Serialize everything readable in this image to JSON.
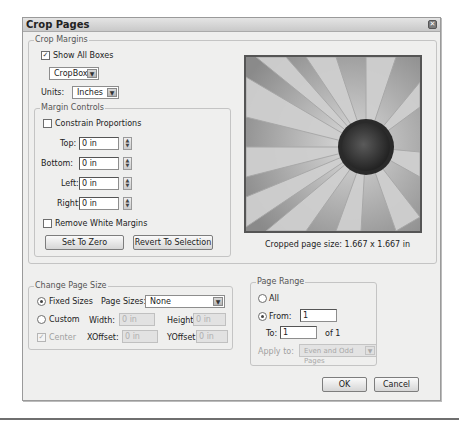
{
  "window": {
    "title": "Crop Pages",
    "close_icon": "close-icon"
  },
  "crop_margins": {
    "legend": "Crop Margins",
    "show_all_boxes": {
      "label": "Show All Boxes",
      "checked": true
    },
    "box_select": {
      "value": "CropBox"
    },
    "units": {
      "label": "Units:",
      "value": "Inches"
    },
    "margin_controls": {
      "legend": "Margin Controls",
      "constrain_proportions": {
        "label": "Constrain Proportions",
        "checked": false
      },
      "top": {
        "label": "Top:",
        "value": "0 in"
      },
      "bottom": {
        "label": "Bottom:",
        "value": "0 in"
      },
      "left": {
        "label": "Left:",
        "value": "0 in"
      },
      "right": {
        "label": "Right:",
        "value": "0 in"
      },
      "remove_white_margins": {
        "label": "Remove White Margins",
        "checked": false
      },
      "set_to_zero_label": "Set To Zero",
      "revert_to_selection_label": "Revert To Selection"
    },
    "preview": {
      "image": "daisy-flower-grayscale",
      "caption": "Cropped page size: 1.667 x 1.667 in"
    }
  },
  "change_page_size": {
    "legend": "Change Page Size",
    "fixed_sizes": {
      "label": "Fixed Sizes",
      "selected": true
    },
    "page_sizes": {
      "label": "Page Sizes:",
      "value": "None"
    },
    "custom": {
      "label": "Custom",
      "selected": false
    },
    "width": {
      "label": "Width:",
      "value": "0 in"
    },
    "height": {
      "label": "Height:",
      "value": "0 in"
    },
    "center": {
      "label": "Center",
      "checked": true,
      "disabled": true
    },
    "xoffset": {
      "label": "XOffset:",
      "value": "0 in"
    },
    "yoffset": {
      "label": "YOffset:",
      "value": "0 in"
    }
  },
  "page_range": {
    "legend": "Page Range",
    "all": {
      "label": "All",
      "selected": false
    },
    "from": {
      "label": "From:",
      "value": "1",
      "selected": true
    },
    "to": {
      "label": "To:",
      "value": "1"
    },
    "of_total": "of 1",
    "apply_to": {
      "label": "Apply to:",
      "value": "Even and Odd Pages"
    }
  },
  "footer": {
    "ok_label": "OK",
    "cancel_label": "Cancel"
  },
  "glyphs": {
    "check": "✓",
    "down": "▼",
    "up": "▲",
    "close": "✕"
  }
}
